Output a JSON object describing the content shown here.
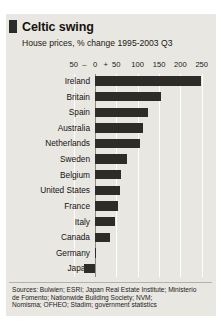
{
  "figure": {
    "title": "Celtic swing",
    "subtitle": "House prices, % change 1995-2003 Q3",
    "accent_color": "#2b2b2b",
    "bar_color": "#2e2c29",
    "background_color": "#e9e7e2",
    "grid_color": "#ffffff"
  },
  "sources": {
    "line1": "Sources: Bulwien; ESRI; Japan Real Estate Institute; Ministerio",
    "line2": "de Fomento; Nationwide Building Society; NVM;",
    "line3": "Nomisma; OFHEO; Stadim; government statistics"
  },
  "axis": {
    "ticks": [
      {
        "label": "50",
        "value": -50
      },
      {
        "label": "–",
        "value": -25
      },
      {
        "label": "0",
        "value": 0
      },
      {
        "label": "+",
        "value": 25
      },
      {
        "label": "50",
        "value": 50
      },
      {
        "label": "100",
        "value": 100
      },
      {
        "label": "150",
        "value": 150
      },
      {
        "label": "200",
        "value": 200
      },
      {
        "label": "250",
        "value": 250
      }
    ]
  },
  "chart_data": {
    "type": "bar",
    "orientation": "horizontal",
    "title": "Celtic swing",
    "subtitle": "House prices, % change 1995-2003 Q3",
    "xlabel": "% change",
    "ylabel": "",
    "xlim": [
      -50,
      260
    ],
    "grid": true,
    "gridlines": [
      -50,
      0,
      50,
      100,
      150,
      200,
      250
    ],
    "legend": "none",
    "categories": [
      "Ireland",
      "Britain",
      "Spain",
      "Australia",
      "Netherlands",
      "Sweden",
      "Belgium",
      "United States",
      "France",
      "Italy",
      "Canada",
      "Germany",
      "Japan"
    ],
    "values": [
      248,
      155,
      125,
      112,
      105,
      75,
      62,
      58,
      55,
      48,
      35,
      2,
      -25
    ]
  }
}
